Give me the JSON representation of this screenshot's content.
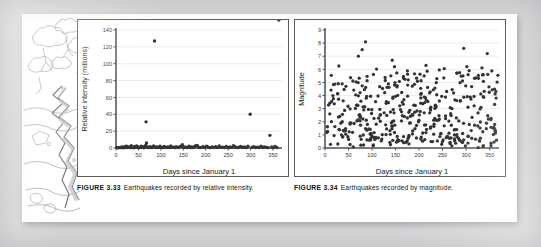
{
  "page": {
    "background_color": "#d7d7d9",
    "sheet_color": "#ffffff"
  },
  "illustration": {
    "name": "earthquake-fissure-sketch",
    "description": "Pencil sketch of a landscape with trees and a jagged earthquake fissure running down the ground",
    "style": "graphite line drawing"
  },
  "figures": [
    {
      "id": "figure-3-33",
      "figure_label": "FIGURE 3.33",
      "caption_text": "Earthquakes recorded by relative intensity.",
      "chart_ref": 0
    },
    {
      "id": "figure-3-34",
      "figure_label": "FIGURE 3.34",
      "caption_text": "Earthquakes recorded by magnitude.",
      "chart_ref": 1
    }
  ],
  "chart_data": [
    {
      "type": "scatter",
      "title": "",
      "xlabel": "Days since January 1",
      "ylabel": "Relative intensity (millions)",
      "xlim": [
        0,
        370
      ],
      "ylim": [
        0,
        140
      ],
      "xticks": [
        0,
        50,
        100,
        150,
        200,
        250,
        300,
        350
      ],
      "xticklabels": [
        "0",
        "50",
        "100",
        "150",
        "200",
        "250",
        "300",
        "350"
      ],
      "yticks": [
        0,
        20,
        40,
        60,
        80,
        100,
        120,
        140
      ],
      "yticklabels": [
        "0",
        "20",
        "40",
        "60",
        "80",
        "100",
        "120",
        "140"
      ],
      "grid": true,
      "grid_axis": "y",
      "legend": false,
      "marker_color": "#333333",
      "point_count": 118,
      "notable_points": [
        {
          "x": 86,
          "y": 127,
          "note": "largest outlier"
        },
        {
          "x": 299,
          "y": 40
        },
        {
          "x": 67,
          "y": 31
        },
        {
          "x": 347,
          "y": 15
        },
        {
          "x": 148,
          "y": 4
        },
        {
          "x": 68,
          "y": 6
        }
      ],
      "x": [
        2,
        4,
        6,
        9,
        11,
        13,
        15,
        17,
        19,
        21,
        23,
        24,
        26,
        28,
        30,
        32,
        34,
        36,
        38,
        40,
        42,
        44,
        46,
        48,
        50,
        52,
        54,
        56,
        58,
        60,
        62,
        64,
        66,
        67,
        68,
        70,
        72,
        74,
        76,
        78,
        80,
        82,
        84,
        86,
        88,
        90,
        92,
        95,
        98,
        101,
        104,
        107,
        110,
        113,
        116,
        119,
        122,
        125,
        128,
        131,
        134,
        137,
        140,
        143,
        146,
        148,
        151,
        154,
        157,
        160,
        163,
        166,
        169,
        172,
        175,
        178,
        181,
        184,
        187,
        190,
        194,
        198,
        202,
        206,
        210,
        214,
        218,
        222,
        226,
        230,
        234,
        238,
        242,
        246,
        250,
        254,
        258,
        262,
        266,
        270,
        274,
        278,
        282,
        286,
        290,
        294,
        299,
        303,
        307,
        311,
        315,
        319,
        323,
        327,
        331,
        335,
        339,
        343,
        347,
        351,
        355,
        359,
        363
      ],
      "y": [
        0.3,
        0.5,
        0.2,
        0.8,
        0.4,
        1.1,
        0.6,
        0.3,
        1.4,
        0.7,
        2.2,
        1.9,
        0.5,
        0.9,
        1.3,
        0.4,
        2.6,
        1.1,
        0.6,
        0.3,
        1.8,
        0.9,
        2.3,
        0.5,
        1.2,
        0.4,
        0.8,
        2.1,
        0.6,
        1.5,
        0.3,
        0.9,
        2.9,
        31,
        6,
        1.2,
        0.5,
        0.8,
        1.6,
        0.4,
        0.7,
        1.1,
        2.4,
        127,
        0.9,
        0.6,
        1.3,
        0.5,
        2.1,
        0.8,
        0.4,
        1.7,
        0.6,
        0.9,
        1.2,
        0.5,
        2.3,
        0.7,
        1.0,
        0.4,
        1.5,
        0.8,
        0.6,
        1.9,
        2.0,
        4.0,
        0.7,
        1.3,
        0.5,
        0.9,
        2.2,
        0.6,
        1.1,
        0.4,
        1.8,
        2.6,
        3.1,
        1.0,
        0.5,
        0.8,
        1.4,
        0.6,
        2.0,
        0.9,
        0.4,
        1.2,
        0.7,
        1.6,
        0.5,
        2.4,
        0.8,
        1.0,
        0.6,
        1.9,
        0.4,
        1.3,
        0.7,
        2.7,
        1.1,
        0.5,
        0.9,
        1.8,
        0.6,
        1.2,
        0.4,
        2.0,
        40,
        0.8,
        1.5,
        0.6,
        1.0,
        0.5,
        2.2,
        0.9,
        1.3,
        0.7,
        0.4,
        15,
        1.1,
        0.6,
        1.8,
        0.5
      ]
    },
    {
      "type": "scatter",
      "title": "",
      "xlabel": "Days since January 1",
      "ylabel": "Magnitude",
      "xlim": [
        0,
        370
      ],
      "ylim": [
        0,
        9
      ],
      "xticks": [
        0,
        50,
        100,
        150,
        200,
        250,
        300,
        350
      ],
      "xticklabels": [
        "0",
        "50",
        "100",
        "150",
        "200",
        "250",
        "300",
        "350"
      ],
      "yticks": [
        0,
        1,
        2,
        3,
        4,
        5,
        6,
        7,
        8,
        9
      ],
      "yticklabels": [
        "0",
        "1",
        "2",
        "3",
        "4",
        "5",
        "6",
        "7",
        "8",
        "9"
      ],
      "grid": true,
      "grid_axis": "y",
      "legend": false,
      "marker_color": "#333333",
      "point_count": 430,
      "notable_points": [
        {
          "x": 86,
          "y": 8.1,
          "note": "largest magnitude"
        },
        {
          "x": 295,
          "y": 7.6
        },
        {
          "x": 79,
          "y": 7.5
        },
        {
          "x": 345,
          "y": 7.2
        },
        {
          "x": 71,
          "y": 7.0
        },
        {
          "x": 143,
          "y": 6.7
        }
      ]
    }
  ]
}
